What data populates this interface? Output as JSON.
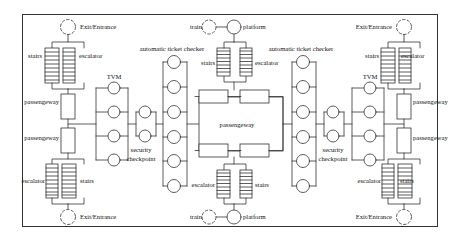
{
  "diagram": {
    "type": "metro-station-topology-network",
    "frame": {
      "stroke": "#333333",
      "fill": "#ffffff"
    },
    "colors": {
      "line": "#333333",
      "node_fill": "#ffffff",
      "text": "#111111"
    },
    "labels": {
      "exit_entrance": "Exit/Entrance",
      "stairs": "stairs",
      "escalator": "escalator",
      "passengeway": "passengeway",
      "tvm": "TVM",
      "security_checkpoint_line1": "security",
      "security_checkpoint_line2": "checkpoint",
      "automatic_ticket_checker": "automatic ticket checker",
      "train": "train",
      "platform": "platform"
    },
    "counts": {
      "tvm_units": 4,
      "security_checkpoint_units": 2,
      "automatic_ticket_checker_units": 6,
      "stair_rungs": 9,
      "escalator_rungs": 9
    },
    "quadrants": [
      {
        "id": "left-top",
        "exit_entrance": "Exit/Entrance",
        "exit_node_style": "dashed",
        "left_element": "stairs",
        "right_element": "escalator",
        "passengeway": "passengeway"
      },
      {
        "id": "left-bottom",
        "exit_entrance": "Exit/Entrance",
        "exit_node_style": "dashed",
        "left_element": "escalator",
        "right_element": "stairs",
        "passengeway": "passengeway"
      },
      {
        "id": "right-top",
        "exit_entrance": "Exit/Entrance",
        "exit_node_style": "dashed",
        "left_element": "stairs",
        "right_element": "escalator",
        "passengeway": "passengeway"
      },
      {
        "id": "right-bottom",
        "exit_entrance": "Exit/Entrance",
        "exit_node_style": "dashed",
        "left_element": "escalator",
        "right_element": "stairs",
        "passengeway": "passengeway"
      }
    ],
    "center": {
      "passengeway": "passengeway",
      "top": {
        "train": "train",
        "platform": "platform",
        "train_node_style": "dashed",
        "platform_node_style": "solid",
        "left_element": "stairs",
        "right_element": "escalator"
      },
      "bottom": {
        "train": "train",
        "platform": "platform",
        "train_node_style": "dashed",
        "platform_node_style": "solid",
        "left_element": "escalator",
        "right_element": "stairs"
      }
    },
    "checker_columns": [
      {
        "id": "checker-left",
        "label": "automatic ticket checker",
        "units": 6
      },
      {
        "id": "checker-right",
        "label": "automatic ticket checker",
        "units": 6
      }
    ],
    "tvm_columns": [
      {
        "id": "tvm-left",
        "label": "TVM",
        "units": 4
      },
      {
        "id": "tvm-right",
        "label": "TVM",
        "units": 4
      }
    ],
    "security_columns": [
      {
        "id": "security-left",
        "label": "security checkpoint",
        "units": 2
      },
      {
        "id": "security-right",
        "label": "security checkpoint",
        "units": 2
      }
    ]
  }
}
